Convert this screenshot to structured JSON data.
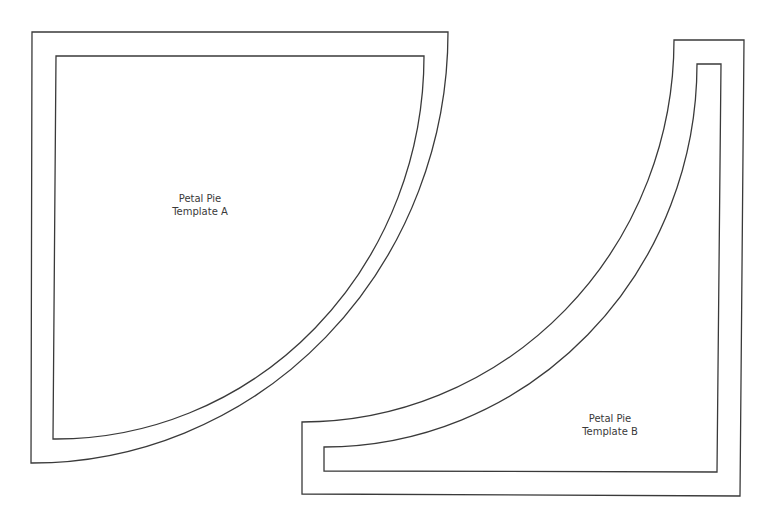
{
  "templates": [
    {
      "id": "A",
      "label_line1": "Petal Pie",
      "label_line2": "Template A"
    },
    {
      "id": "B",
      "label_line1": "Petal Pie",
      "label_line2": "Template B"
    }
  ],
  "colors": {
    "stroke": "#3a3a3a",
    "background": "#ffffff"
  }
}
